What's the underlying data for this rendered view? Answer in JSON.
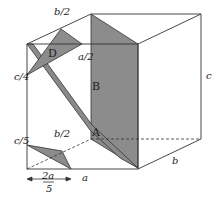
{
  "diagram": {
    "type": "3D box with shaded cross-section planes",
    "colors": {
      "line": "#333333",
      "shade": "#8c8c8c",
      "shade_dark": "#777777",
      "background": "#ffffff"
    },
    "regions": [
      {
        "id": "A",
        "label": "A"
      },
      {
        "id": "B",
        "label": "B"
      },
      {
        "id": "D",
        "label": "D"
      }
    ],
    "edge_labels": {
      "a": "a",
      "b": "b",
      "c": "c",
      "b_half_top": "b/2",
      "a_half": "a/2",
      "c_quarter": "c/4",
      "c_fifth": "c/5",
      "b_half_bottom": "b/2",
      "two_a_fifths_num": "2a",
      "two_a_fifths_den": "5"
    }
  }
}
